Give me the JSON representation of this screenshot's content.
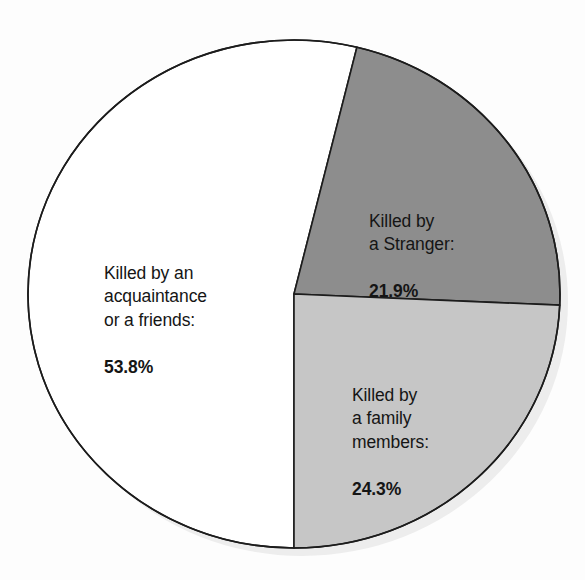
{
  "chart_data": {
    "type": "pie",
    "title": "",
    "subtitle": "",
    "xlabel": "",
    "ylabel": "",
    "legend_position": "none",
    "labels_inline": true,
    "total_percent": 100.0,
    "categories": [
      "Killed by an acquaintance or a friends",
      "Killed by a Stranger",
      "Killed by a family members"
    ],
    "values": [
      53.8,
      21.9,
      24.3
    ],
    "slices": [
      {
        "key": "acquaintance",
        "label_text": "Killed by an\nacquaintance\nor a friends:",
        "label_value": "53.8%",
        "value": 53.8,
        "color": "#ffffff",
        "stroke": "#1c1c1c",
        "start_angle_deg": 180.0,
        "end_angle_deg": 373.68
      },
      {
        "key": "stranger",
        "label_text": "Killed by\na Stranger:",
        "label_value": "21.9%",
        "value": 21.9,
        "color": "#8d8d8d",
        "stroke": "#1c1c1c",
        "start_angle_deg": 13.68,
        "end_angle_deg": 92.52
      },
      {
        "key": "family",
        "label_text": "Killed by\na family\nmembers:",
        "label_value": "24.3%",
        "value": 24.3,
        "color": "#c6c6c6",
        "stroke": "#1c1c1c",
        "start_angle_deg": 92.52,
        "end_angle_deg": 180.0
      }
    ]
  },
  "geometry": {
    "center_x": 294,
    "center_y": 294,
    "radius_x": 266,
    "radius_y": 254,
    "outline_color": "#1c1c1c",
    "outline_width": 1.6,
    "background": "#fdfdfd"
  },
  "colors": {
    "background": "#fdfdfd",
    "slice_white": "#ffffff",
    "slice_dark_gray": "#8d8d8d",
    "slice_light_gray": "#c6c6c6",
    "outline": "#1c1c1c",
    "text": "#151515",
    "shadow": "#ededed"
  }
}
